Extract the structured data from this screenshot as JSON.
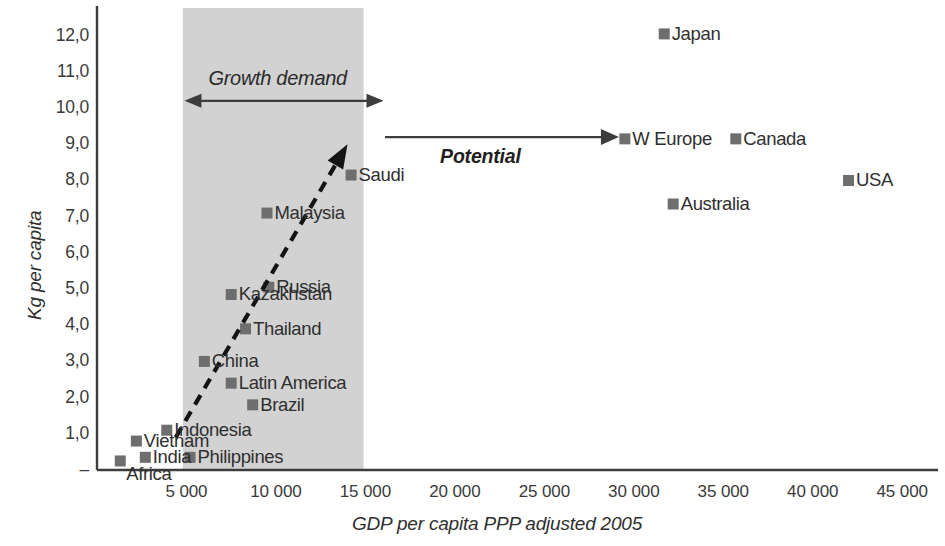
{
  "chart_data": {
    "type": "scatter",
    "title": "",
    "xlabel": "GDP per capita PPP adjusted 2005",
    "ylabel": "Kg per capita",
    "xlim": [
      0,
      47000
    ],
    "ylim": [
      0,
      12.6
    ],
    "grid": false,
    "legend": "none",
    "x_tick_labels": [
      "5 000",
      "10 000",
      "15 000",
      "20 000",
      "25 000",
      "30 000",
      "35 000",
      "40 000",
      "45 000"
    ],
    "x_tick_values": [
      5000,
      10000,
      15000,
      20000,
      25000,
      30000,
      35000,
      40000,
      45000
    ],
    "y_tick_labels": [
      "–",
      "1,0",
      "2,0",
      "3,0",
      "4,0",
      "5,0",
      "6,0",
      "7,0",
      "8,0",
      "9,0",
      "10,0",
      "11,0",
      "12,0"
    ],
    "y_tick_values": [
      0,
      1,
      2,
      3,
      4,
      5,
      6,
      7,
      8,
      9,
      10,
      11,
      12
    ],
    "points": [
      {
        "label": "Africa",
        "x": 1300,
        "y": 0.25,
        "label_pos": "below"
      },
      {
        "label": "India",
        "x": 2700,
        "y": 0.35,
        "label_pos": "right"
      },
      {
        "label": "Vietnam",
        "x": 2200,
        "y": 0.8,
        "label_pos": "right"
      },
      {
        "label": "Indonesia",
        "x": 3900,
        "y": 1.1,
        "label_pos": "right"
      },
      {
        "label": "Philippines",
        "x": 5200,
        "y": 0.35,
        "label_pos": "right"
      },
      {
        "label": "Brazil",
        "x": 8700,
        "y": 1.8,
        "label_pos": "right"
      },
      {
        "label": "Latin America",
        "x": 7500,
        "y": 2.4,
        "label_pos": "right"
      },
      {
        "label": "China",
        "x": 6000,
        "y": 3.0,
        "label_pos": "right"
      },
      {
        "label": "Thailand",
        "x": 8300,
        "y": 3.9,
        "label_pos": "right"
      },
      {
        "label": "Kazakhstan",
        "x": 7500,
        "y": 4.85,
        "label_pos": "right"
      },
      {
        "label": "Russia",
        "x": 9600,
        "y": 5.05,
        "label_pos": "right"
      },
      {
        "label": "Malaysia",
        "x": 9500,
        "y": 7.1,
        "label_pos": "right"
      },
      {
        "label": "Saudi",
        "x": 14200,
        "y": 8.15,
        "label_pos": "right"
      },
      {
        "label": "Japan",
        "x": 31700,
        "y": 12.05,
        "label_pos": "right"
      },
      {
        "label": "W Europe",
        "x": 29500,
        "y": 9.15,
        "label_pos": "right"
      },
      {
        "label": "Canada",
        "x": 35700,
        "y": 9.15,
        "label_pos": "right"
      },
      {
        "label": "Australia",
        "x": 32200,
        "y": 7.35,
        "label_pos": "right"
      },
      {
        "label": "USA",
        "x": 42000,
        "y": 8.0,
        "label_pos": "right"
      }
    ],
    "annotations": [
      {
        "name": "growth-demand",
        "text": "Growth demand",
        "arrow": "double",
        "x_from": 5000,
        "x_to": 15900,
        "y": 10.2
      },
      {
        "name": "potential",
        "text": "Potential",
        "arrow": "right",
        "x_from": 16100,
        "x_to": 29000,
        "y": 9.2
      }
    ],
    "shaded_band": {
      "x_from": 4800,
      "x_to": 14900,
      "color": "#d2d2d2",
      "label": "growth-demand-band"
    },
    "trend_arrow": {
      "type": "dashed-up-right",
      "from": [
        4400,
        0.9
      ],
      "to": [
        14000,
        9.0
      ],
      "color": "#141414"
    }
  },
  "colors": {
    "marker": "#6e6e6e",
    "band": "#d2d2d2",
    "axis": "#3d3d3d",
    "text": "#2f2f2f",
    "trend": "#141414"
  }
}
